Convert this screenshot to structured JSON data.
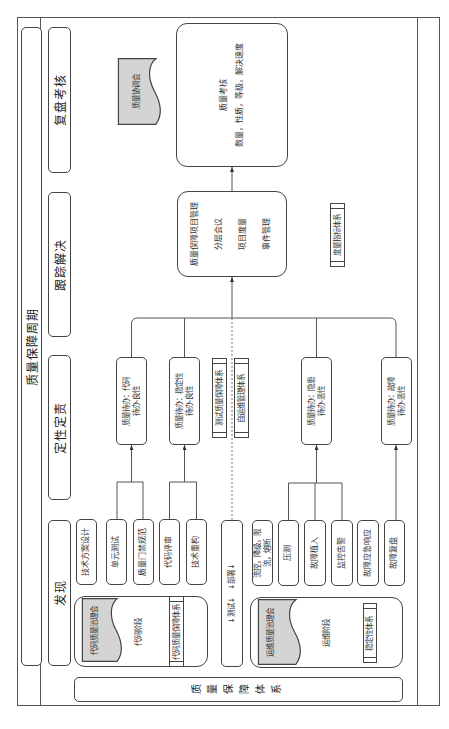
{
  "title": "质量保障周期",
  "phases": [
    {
      "label": "发现"
    },
    {
      "label": "定性定责"
    },
    {
      "label": "跟踪解决"
    },
    {
      "label": "复盘考核"
    }
  ],
  "system": {
    "label": "质量保障体系"
  },
  "discovery": {
    "code_items": [
      "技术方案设计",
      "单元测试",
      "质量门禁规范",
      "代码评审",
      "技术重构"
    ],
    "pipeline": "↓测试↓　↓部署↓",
    "ops_items": [
      "流控，降级，限流，熔断",
      "压测",
      "故障植入",
      "监控告警",
      "故障应急响应",
      "故障复盘"
    ],
    "code_stage": {
      "meeting": "代码质量治理会",
      "label": "代码阶段",
      "system": "代码质量保障体系"
    },
    "ops_stage": {
      "meeting": "运维质量治理会",
      "label": "运维阶段",
      "system": "稳定性体系"
    }
  },
  "qualification": {
    "todos": [
      {
        "title": "质量待办：代码",
        "sub": "待办-良性"
      },
      {
        "title": "质量待办：稳定性",
        "sub": "待办-良性"
      },
      {
        "title": "质量待办：隐患",
        "sub": "待办-恶性"
      },
      {
        "title": "质量待办：故障",
        "sub": "待办-恶性"
      }
    ],
    "systems": [
      "测试质量保障体系",
      "自运维管理体系"
    ]
  },
  "tracking": {
    "title": "质量保障项目管理",
    "items": [
      "分层会议",
      "项目度量",
      "事件管理"
    ],
    "system": "度量指标体系"
  },
  "review": {
    "meeting": "质量协调会",
    "title": "质量考核",
    "criteria": "数量，性质，等级，解决速度"
  },
  "colors": {
    "line": "#444444",
    "document_fill": "#d4d4d4",
    "background": "#ffffff",
    "text": "#333333"
  }
}
